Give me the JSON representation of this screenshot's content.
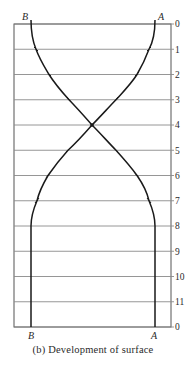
{
  "figure": {
    "caption": "(b)  Development of surface",
    "top_labels": {
      "left": "B",
      "right": "A"
    },
    "bottom_labels": {
      "left": "B",
      "right": "A"
    },
    "station_labels": [
      "0",
      "1",
      "2",
      "3",
      "4",
      "5",
      "6",
      "7",
      "8",
      "9",
      "10",
      "11",
      "0"
    ],
    "colors": {
      "line": "#8a8a8a",
      "curve": "#1a1a1a",
      "frame": "#555555"
    }
  }
}
